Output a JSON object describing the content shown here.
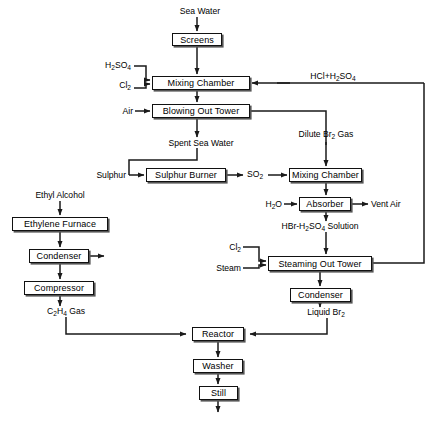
{
  "diagram": {
    "line_color": "#1a1a1a",
    "box_fill": "#ffffff",
    "boxes": [
      {
        "id": "screens",
        "label": "Screens",
        "x": 172,
        "y": 33,
        "w": 50,
        "h": 13
      },
      {
        "id": "mixing1",
        "label": "Mixing Chamber",
        "x": 152,
        "y": 76,
        "w": 98,
        "h": 14
      },
      {
        "id": "blowing",
        "label": "Blowing Out Tower",
        "x": 152,
        "y": 104,
        "w": 98,
        "h": 14
      },
      {
        "id": "sulphur",
        "label": "Sulphur Burner",
        "x": 146,
        "y": 168,
        "w": 80,
        "h": 14
      },
      {
        "id": "mixing2",
        "label": "Mixing Chamber",
        "x": 289,
        "y": 168,
        "w": 73,
        "h": 14
      },
      {
        "id": "absorber",
        "label": "Absorber",
        "x": 299,
        "y": 197,
        "w": 52,
        "h": 14
      },
      {
        "id": "furnace",
        "label": "Ethylene Furnace",
        "x": 12,
        "y": 217,
        "w": 96,
        "h": 14
      },
      {
        "id": "condenser-left",
        "label": "Condenser",
        "x": 29,
        "y": 249,
        "w": 60,
        "h": 14
      },
      {
        "id": "compressor",
        "label": "Compressor",
        "x": 24,
        "y": 281,
        "w": 70,
        "h": 14
      },
      {
        "id": "steaming",
        "label": "Steaming Out Tower",
        "x": 268,
        "y": 256,
        "w": 104,
        "h": 15
      },
      {
        "id": "condenser-right",
        "label": "Condenser",
        "x": 290,
        "y": 288,
        "w": 61,
        "h": 14
      },
      {
        "id": "reactor",
        "label": "Reactor",
        "x": 192,
        "y": 327,
        "w": 52,
        "h": 14
      },
      {
        "id": "washer",
        "label": "Washer",
        "x": 193,
        "y": 359,
        "w": 50,
        "h": 14
      },
      {
        "id": "still",
        "label": "Still",
        "x": 199,
        "y": 386,
        "w": 39,
        "h": 14
      }
    ],
    "labels": [
      {
        "id": "sea-water",
        "text": "Sea Water",
        "x": 200,
        "y": 13,
        "align": "c"
      },
      {
        "id": "h2so4-in",
        "text": "H₂SO₄",
        "x": 131,
        "y": 68,
        "align": "r",
        "html": "H<sub>2</sub>SO<sub>4</sub>"
      },
      {
        "id": "cl2-in",
        "text": "Cl₂",
        "x": 131,
        "y": 86,
        "align": "r",
        "html": "Cl<sub>2</sub>"
      },
      {
        "id": "hcl-h2so4",
        "text": "HCl+H₂SO₄",
        "x": 310,
        "y": 79,
        "align": "c",
        "html": "HCl+H<sub>2</sub>SO<sub>4</sub>"
      },
      {
        "id": "air-in",
        "text": "Air",
        "x": 131,
        "y": 108,
        "align": "r"
      },
      {
        "id": "spent-sea-water",
        "text": "Spent Sea Water",
        "x": 201,
        "y": 143,
        "align": "c"
      },
      {
        "id": "dilute-br2-gas",
        "text": "Dilute Br₂ Gas",
        "x": 326,
        "y": 140,
        "align": "c",
        "html": "Dilute Br<sub>2</sub> Gas"
      },
      {
        "id": "sulphur-in",
        "text": "Sulphur",
        "x": 126,
        "y": 172,
        "align": "r"
      },
      {
        "id": "so2",
        "text": "SO₂",
        "x": 255,
        "y": 172,
        "align": "c",
        "html": "SO<sub>2</sub>"
      },
      {
        "id": "h2o-in",
        "text": "H₂O",
        "x": 281,
        "y": 200,
        "align": "r",
        "html": "H<sub>2</sub>O"
      },
      {
        "id": "vent-air",
        "text": "Vent Air",
        "x": 371,
        "y": 200,
        "align": "l"
      },
      {
        "id": "hbr-h2so4-sol",
        "text": "HBr-H₂SO₄ Solution",
        "x": 320,
        "y": 227,
        "align": "c",
        "html": "HBr-H<sub>2</sub>SO<sub>4</sub> Solution"
      },
      {
        "id": "ethyl-alcohol",
        "text": "Ethyl Alcohol",
        "x": 60,
        "y": 197,
        "align": "c"
      },
      {
        "id": "cl2-steaming",
        "text": "Cl₂",
        "x": 240,
        "y": 249,
        "align": "r",
        "html": "Cl<sub>2</sub>"
      },
      {
        "id": "steam-in",
        "text": "Steam",
        "x": 240,
        "y": 265,
        "align": "r"
      },
      {
        "id": "c2h4-gas",
        "text": "C₂H₄ Gas",
        "x": 66,
        "y": 312,
        "align": "c",
        "html": "C<sub>2</sub>H<sub>4</sub> Gas"
      },
      {
        "id": "liquid-br2",
        "text": "Liquid Br₂",
        "x": 326,
        "y": 313,
        "align": "c",
        "html": "Liquid Br<sub>2</sub>"
      },
      {
        "id": "ethylene-dibromide",
        "text": "Ethylene Dibromide",
        "x": 219,
        "y": 418,
        "align": "c"
      }
    ]
  }
}
